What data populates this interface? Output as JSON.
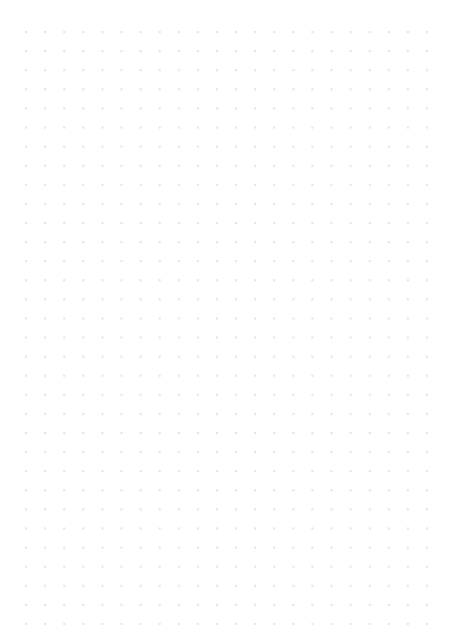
{
  "document": {
    "kind": "dot-grid-paper",
    "title": "Dot Grid Paper",
    "page_width": 453,
    "page_height": 643,
    "background_color": "#ffffff",
    "orientation": "portrait"
  },
  "grid": {
    "type": "dot",
    "dot_color": "#e4e4e6",
    "dot_diameter": 2,
    "spacing_x": 19.1,
    "spacing_y": 19.1,
    "columns": 22,
    "rows": 32,
    "first_dot_x": 26,
    "first_dot_y": 32,
    "last_dot_x": 427,
    "last_dot_y": 620
  },
  "margins": {
    "left": 26,
    "right": 26,
    "top": 32,
    "bottom": 23
  },
  "content": {
    "text_blocks": [],
    "note": ""
  }
}
